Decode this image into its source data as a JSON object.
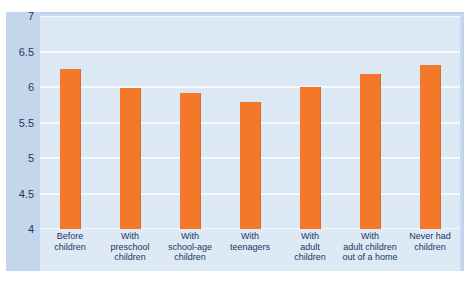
{
  "chart_data": {
    "type": "bar",
    "title": "",
    "xlabel": "",
    "ylabel": "",
    "ylim": [
      4,
      7
    ],
    "grid": true,
    "legend": "none",
    "bar_color": "#f4782a",
    "plot_background": "#dce9f4",
    "axis_band_color": "#c3d6ec",
    "frame_color": "#c7d9ee",
    "text_color": "#22365e",
    "categories": [
      "Before\nchildren",
      "With\npreschool\nchildren",
      "With\nschool-age\nchildren",
      "With\nteenagers",
      "With\nadult\nchildren",
      "With\nadult children\nout of a home",
      "Never had\nchildren"
    ],
    "values": [
      6.26,
      5.99,
      5.91,
      5.79,
      6.0,
      6.19,
      6.31
    ],
    "yticks": [
      "7",
      "6.5",
      "6",
      "5.5",
      "5",
      "4.5",
      "4"
    ],
    "ytick_values": [
      7,
      6.5,
      6,
      5.5,
      5,
      4.5,
      4
    ]
  }
}
